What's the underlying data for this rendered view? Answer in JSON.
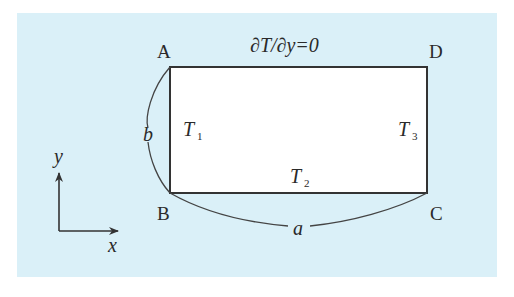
{
  "diagram": {
    "type": "rectangular heat conduction domain",
    "colors": {
      "background": "#daf0f8",
      "plate": "#ffffff",
      "stroke": "#333333"
    },
    "corners": {
      "top_left": "A",
      "top_right": "D",
      "bottom_left": "B",
      "bottom_right": "C"
    },
    "boundary_conditions": {
      "top": "∂T/∂y=0",
      "left": {
        "symbol": "T",
        "subscript": "1"
      },
      "bottom": {
        "symbol": "T",
        "subscript": "2"
      },
      "right": {
        "symbol": "T",
        "subscript": "3"
      }
    },
    "dimensions": {
      "width": "a",
      "height": "b"
    },
    "axes": {
      "x": "x",
      "y": "y"
    }
  }
}
